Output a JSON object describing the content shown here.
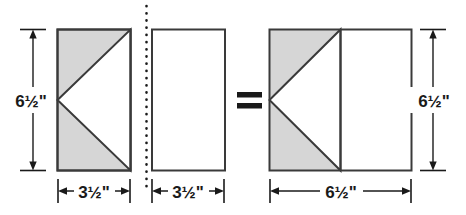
{
  "diagram": {
    "kind": "quilt-block-assembly-diagram",
    "colors": {
      "shaded_fill": "#D6D6D6",
      "plain_fill": "#FFFFFF",
      "outline": "#3A3A3A",
      "dimension_line": "#1A1A1A",
      "text": "#1A1A1A",
      "background": "#FFFFFF"
    },
    "operator": {
      "symbol": "=",
      "name": "equals-sign"
    },
    "separator": {
      "style": "dotted",
      "orientation": "vertical"
    },
    "units": [
      {
        "id": "pieced-unit",
        "name": "flying-geese-unit",
        "fill": "shaded",
        "has_triangle": true,
        "triangle_direction": "left",
        "width_label": "3½\"",
        "height_label": "6½\"",
        "width_value": 3.5,
        "height_value": 6.5
      },
      {
        "id": "plain-rectangle",
        "name": "plain-rectangle-unit",
        "fill": "plain",
        "has_triangle": false,
        "triangle_direction": "none",
        "width_label": "3½\"",
        "height_label": "",
        "width_value": 3.5,
        "height_value": 6.5
      },
      {
        "id": "assembled-square",
        "name": "assembled-square-unit",
        "fill": "mixed",
        "has_triangle": true,
        "triangle_direction": "left",
        "width_label": "6½\"",
        "height_label": "6½\"",
        "width_value": 6.5,
        "height_value": 6.5
      }
    ],
    "labels": {
      "left_height": "6½\"",
      "unit1_width": "3½\"",
      "unit2_width": "3½\"",
      "result_width": "6½\"",
      "result_height": "6½\"",
      "equals": "="
    }
  }
}
